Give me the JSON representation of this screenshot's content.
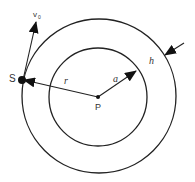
{
  "diagram": {
    "type": "geometry",
    "center": {
      "label": "P"
    },
    "point": {
      "label": "S"
    },
    "labels": {
      "center": "P",
      "satellite": "S",
      "velocity": "v",
      "velocity_sub": "0",
      "outer_radius": "r",
      "inner_radius": "a",
      "thickness": "h"
    },
    "colors": {
      "stroke": "#222222",
      "background": "#ffffff"
    }
  }
}
